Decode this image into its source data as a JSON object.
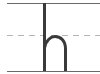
{
  "glyph": {
    "letter": "h",
    "stroke_color": "#3a3a3a"
  },
  "guides": {
    "top_line_color": "#6a6a6a",
    "mid_line_color": "#b5b5b5",
    "baseline_color": "#6a6a6a"
  }
}
